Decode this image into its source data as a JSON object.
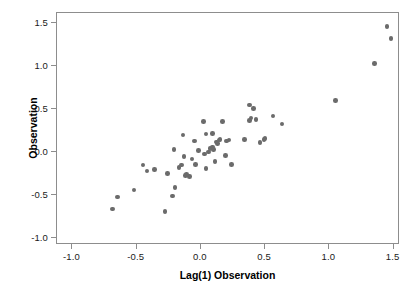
{
  "chart_data": {
    "type": "scatter",
    "title": "",
    "xlabel": "Lag(1) Observation",
    "ylabel": "Observation",
    "xlim": [
      -1.12,
      1.55
    ],
    "ylim": [
      -1.08,
      1.62
    ],
    "grid": false,
    "legend": null,
    "xticks": [
      -1.0,
      -0.5,
      0.0,
      0.5,
      1.0,
      1.5
    ],
    "xticklabels": [
      "-1.0",
      "-0.5",
      "0.0",
      "0.5",
      "1.0",
      "1.5"
    ],
    "yticks": [
      -1.0,
      -0.5,
      0.0,
      0.5,
      1.0,
      1.5
    ],
    "yticklabels": [
      "-1.0",
      "-0.5",
      "0.0",
      "0.5",
      "1.0",
      "1.5"
    ],
    "marker_color": "#6b6b6b",
    "marker_size": 4.6,
    "frame_color": "#8d8d8d",
    "n_points": 56,
    "points": [
      [
        -0.69,
        -0.66
      ],
      [
        -0.65,
        -0.52
      ],
      [
        -0.52,
        -0.44
      ],
      [
        -0.45,
        -0.15
      ],
      [
        -0.42,
        -0.22
      ],
      [
        -0.36,
        -0.2
      ],
      [
        -0.28,
        -0.69
      ],
      [
        -0.26,
        -0.25
      ],
      [
        -0.22,
        -0.51
      ],
      [
        -0.21,
        0.03
      ],
      [
        -0.2,
        -0.41
      ],
      [
        -0.17,
        -0.18
      ],
      [
        -0.15,
        -0.15
      ],
      [
        -0.14,
        0.2
      ],
      [
        -0.13,
        -0.05
      ],
      [
        -0.12,
        -0.27
      ],
      [
        -0.09,
        -0.28
      ],
      [
        -0.07,
        -0.08
      ],
      [
        -0.05,
        0.13
      ],
      [
        -0.04,
        -0.14
      ],
      [
        -0.02,
        0.02
      ],
      [
        0.02,
        0.36
      ],
      [
        0.03,
        -0.02
      ],
      [
        0.04,
        0.21
      ],
      [
        0.04,
        -0.19
      ],
      [
        0.07,
        0.04
      ],
      [
        0.09,
        0.22
      ],
      [
        0.09,
        0.06
      ],
      [
        0.1,
        0.03
      ],
      [
        0.11,
        -0.11
      ],
      [
        0.12,
        0.12
      ],
      [
        0.13,
        0.1
      ],
      [
        0.14,
        0.14
      ],
      [
        0.15,
        0.15
      ],
      [
        0.17,
        0.36
      ],
      [
        0.19,
        -0.04
      ],
      [
        0.22,
        0.14
      ],
      [
        0.24,
        -0.14
      ],
      [
        0.34,
        0.15
      ],
      [
        0.38,
        0.55
      ],
      [
        0.38,
        0.37
      ],
      [
        0.39,
        0.4
      ],
      [
        0.41,
        0.51
      ],
      [
        0.43,
        0.38
      ],
      [
        0.46,
        0.11
      ],
      [
        0.49,
        0.15
      ],
      [
        0.5,
        0.16
      ],
      [
        0.56,
        0.42
      ],
      [
        0.63,
        0.33
      ],
      [
        1.05,
        0.6
      ],
      [
        1.35,
        1.03
      ],
      [
        1.45,
        1.46
      ],
      [
        1.48,
        1.32
      ],
      [
        0.2,
        0.13
      ],
      [
        0.06,
        0.0
      ],
      [
        -0.11,
        -0.26
      ]
    ]
  },
  "axes": {
    "x_title": "Lag(1) Observation",
    "y_title": "Observation"
  }
}
